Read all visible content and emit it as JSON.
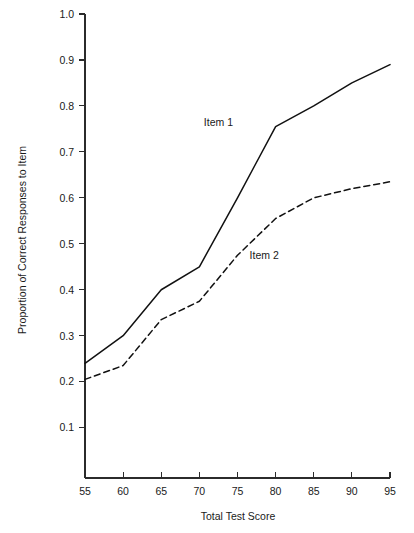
{
  "chart_data": {
    "type": "line",
    "title": "",
    "subtitle": "",
    "xlabel": "Total Test Score",
    "ylabel": "Proportion of Correct Responses to Item",
    "xlim": [
      55,
      95
    ],
    "ylim": [
      0.0,
      1.0
    ],
    "grid": false,
    "legend_position": "inline-annotation",
    "x": [
      55,
      60,
      65,
      70,
      75,
      80,
      85,
      90,
      95
    ],
    "xticks": [
      "55",
      "60",
      "65",
      "70",
      "75",
      "80",
      "85",
      "90",
      "95"
    ],
    "yticks": [
      "0.1",
      "0.2",
      "0.3",
      "0.4",
      "0.5",
      "0.6",
      "0.7",
      "0.8",
      "0.9",
      "1.0"
    ],
    "ytick_values": [
      0.1,
      0.2,
      0.3,
      0.4,
      0.5,
      0.6,
      0.7,
      0.8,
      0.9,
      1.0
    ],
    "series": [
      {
        "name": "Item 1",
        "style": "solid",
        "color": "#111111",
        "values": [
          0.24,
          0.3,
          0.4,
          0.45,
          0.6,
          0.755,
          0.8,
          0.85,
          0.89
        ],
        "annotation": {
          "label": "Item 1",
          "x": 72.5,
          "y": 0.765
        }
      },
      {
        "name": "Item 2",
        "style": "dashed",
        "color": "#111111",
        "values": [
          0.205,
          0.235,
          0.335,
          0.375,
          0.475,
          0.555,
          0.6,
          0.62,
          0.635
        ],
        "annotation": {
          "label": "Item 2",
          "x": 78.5,
          "y": 0.475
        }
      }
    ]
  }
}
